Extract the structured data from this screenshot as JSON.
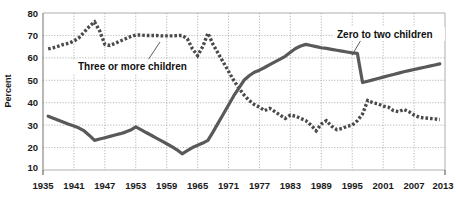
{
  "chart_data": {
    "type": "line",
    "title": "",
    "xlabel": "",
    "ylabel": "Percent",
    "xlim": [
      1935,
      2013
    ],
    "ylim": [
      10,
      80
    ],
    "grid": true,
    "legend_position": "inline-annotations",
    "x_ticks": [
      "1935",
      "1941",
      "1947",
      "1953",
      "1959",
      "1965",
      "1971",
      "1977",
      "1983",
      "1989",
      "1995",
      "2001",
      "2007",
      "2013"
    ],
    "y_ticks": [
      "10",
      "20",
      "30",
      "40",
      "50",
      "60",
      "70",
      "80"
    ],
    "series": [
      {
        "name": "Zero to two children",
        "style": "solid",
        "color": "#58595b",
        "x": [
          1936,
          1937,
          1938,
          1939,
          1940,
          1941,
          1942,
          1943,
          1944,
          1945,
          1946,
          1947,
          1948,
          1949,
          1950,
          1951,
          1952,
          1953,
          1954,
          1955,
          1956,
          1957,
          1958,
          1959,
          1960,
          1961,
          1962,
          1963,
          1964,
          1965,
          1966,
          1967,
          1968,
          1969,
          1970,
          1971,
          1972,
          1973,
          1974,
          1975,
          1976,
          1977,
          1978,
          1979,
          1980,
          1981,
          1982,
          1983,
          1984,
          1985,
          1986,
          1987,
          1988,
          1989,
          1990,
          1991,
          1992,
          1993,
          1994,
          1995,
          1996,
          1997,
          1998,
          1999,
          2000,
          2001,
          2002,
          2003,
          2004,
          2005,
          2006,
          2007,
          2008,
          2009,
          2010,
          2011,
          2012
        ],
        "values": [
          34,
          33.1,
          32.2,
          31.3,
          30.4,
          29.6,
          28.7,
          27.4,
          25.4,
          23.2,
          23.8,
          24.4,
          25.0,
          25.6,
          26.2,
          26.9,
          27.8,
          29.2,
          28.0,
          26.7,
          25.5,
          24.2,
          23.0,
          21.7,
          20.4,
          19.0,
          17.2,
          18.6,
          20.0,
          21.0,
          22.0,
          23.2,
          27.0,
          31.0,
          35.0,
          39.0,
          43.0,
          46.5,
          50.0,
          52.0,
          53.6,
          54.5,
          55.7,
          57.0,
          58.2,
          59.4,
          60.7,
          62.5,
          64.2,
          65.3,
          66.0,
          65.5,
          65.0,
          64.5,
          64.2,
          63.8,
          63.4,
          63.0,
          62.6,
          62.2,
          62.0,
          49.0,
          49.6,
          50.2,
          50.8,
          51.4,
          52.0,
          52.6,
          53.2,
          53.8,
          54.3,
          54.8,
          55.3,
          55.8,
          56.3,
          56.8,
          57.3
        ]
      },
      {
        "name": "Three or more children",
        "style": "dotted",
        "color": "#4a4a4a",
        "x": [
          1936,
          1937,
          1938,
          1939,
          1940,
          1941,
          1942,
          1943,
          1944,
          1945,
          1946,
          1947,
          1948,
          1949,
          1950,
          1951,
          1952,
          1953,
          1954,
          1955,
          1956,
          1957,
          1958,
          1959,
          1960,
          1961,
          1962,
          1963,
          1964,
          1965,
          1966,
          1967,
          1968,
          1969,
          1970,
          1971,
          1972,
          1973,
          1974,
          1975,
          1976,
          1977,
          1978,
          1979,
          1980,
          1981,
          1982,
          1983,
          1984,
          1985,
          1986,
          1987,
          1988,
          1989,
          1990,
          1991,
          1992,
          1993,
          1994,
          1995,
          1996,
          1997,
          1998,
          1999,
          2000,
          2001,
          2002,
          2003,
          2004,
          2005,
          2006,
          2007,
          2008,
          2009,
          2010,
          2011,
          2012
        ],
        "values": [
          64,
          64.5,
          65.2,
          66.0,
          66.5,
          67.5,
          69.0,
          71.5,
          74.0,
          76.0,
          72.0,
          66.0,
          65.5,
          66.5,
          67.5,
          68.5,
          69.5,
          70.2,
          70.2,
          70.0,
          70.0,
          70.0,
          69.8,
          69.8,
          69.8,
          69.9,
          70.0,
          68.5,
          64.0,
          61.0,
          65.0,
          71.0,
          66.0,
          62.0,
          58.0,
          54.0,
          50.0,
          46.5,
          43.5,
          41.0,
          39.2,
          38.0,
          36.5,
          37.5,
          36.0,
          34.5,
          33.0,
          34.5,
          34.0,
          33.0,
          32.0,
          30.0,
          27.5,
          30.5,
          32.0,
          29.5,
          28.0,
          28.5,
          29.5,
          30.0,
          32.0,
          35.0,
          41.0,
          40.0,
          39.5,
          38.5,
          38.0,
          36.5,
          36.0,
          37.0,
          36.0,
          34.5,
          33.5,
          33.2,
          33.0,
          32.8,
          32.5
        ]
      }
    ],
    "annotations": [
      {
        "text": "Three or more children",
        "series": "Three or more children"
      },
      {
        "text": "Zero to two children",
        "series": "Zero to two children"
      }
    ]
  },
  "labels": {
    "y_axis_title": "Percent",
    "series_three_or_more": "Three or more children",
    "series_zero_to_two": "Zero to two children"
  },
  "colors": {
    "solid_series": "#58595b",
    "dotted_series": "#4a4a4a",
    "grid": "#9a9a9a",
    "axis": "#7d7d7d",
    "text": "#1a1a1a",
    "background": "#ffffff"
  }
}
